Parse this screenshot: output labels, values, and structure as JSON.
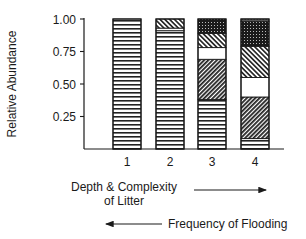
{
  "chart_data": {
    "type": "bar",
    "stacked": true,
    "title": "",
    "xlabel": "Depth & Complexity of Litter",
    "xlabel_lines": [
      "Depth & Complexity",
      "of Litter"
    ],
    "secondary_xlabel": "Frequency of Flooding",
    "ylabel": "Relative Abundance",
    "ylim": [
      0,
      1.0
    ],
    "yticks": [
      "0.25",
      "0.50",
      "0.75",
      "1.00"
    ],
    "categories": [
      "1",
      "2",
      "3",
      "4"
    ],
    "annotations": [
      {
        "text": "Depth & Complexity of Litter",
        "arrow": "right"
      },
      {
        "text": "Frequency of Flooding",
        "arrow": "left"
      }
    ],
    "series": [
      {
        "name": "horizontal-lines",
        "pattern": "horizontal",
        "values": [
          1.0,
          0.91,
          0.38,
          0.08
        ]
      },
      {
        "name": "dense-diagonal-down",
        "pattern": "diag-down-dense",
        "values": [
          0,
          0,
          0.31,
          0.32
        ]
      },
      {
        "name": "white",
        "pattern": "blank",
        "values": [
          0,
          0.02,
          0.09,
          0.15
        ]
      },
      {
        "name": "diagonal-up",
        "pattern": "diag-up",
        "values": [
          0,
          0.07,
          0.11,
          0.24
        ]
      },
      {
        "name": "dense-dots",
        "pattern": "dots-dense",
        "values": [
          0,
          0,
          0.11,
          0.19
        ]
      },
      {
        "name": "sparse-dots",
        "pattern": "dots-sparse",
        "values": [
          0,
          0,
          0,
          0.02
        ]
      }
    ],
    "legend": null,
    "grid": false
  },
  "labels": {
    "y_axis": "Relative Abundance",
    "x_line1": "Depth & Complexity",
    "x_line2": "of Litter",
    "flooding": "Frequency of Flooding"
  }
}
